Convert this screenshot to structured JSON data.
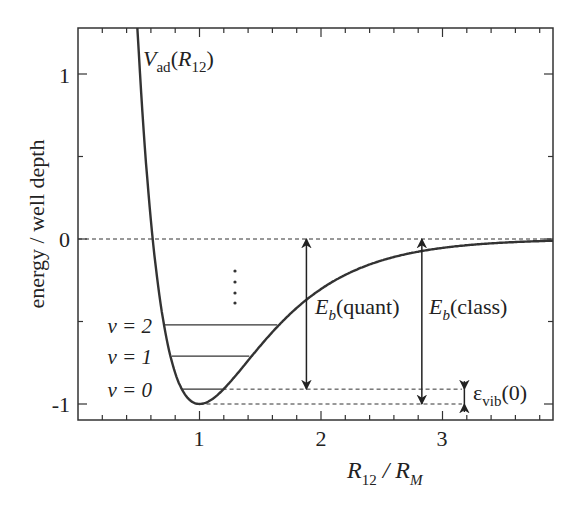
{
  "chart_data": {
    "type": "line",
    "title": "",
    "xlabel": "R12 / RM",
    "ylabel": "energy / well depth",
    "xlim": [
      0.0,
      3.92
    ],
    "ylim": [
      -1.12,
      1.28
    ],
    "x_ticks_major": [
      1,
      2,
      3
    ],
    "x_tick_labels": [
      "1",
      "2",
      "3"
    ],
    "x_minor_step": 0.2,
    "y_ticks_major": [
      1,
      0,
      -1
    ],
    "y_tick_labels": [
      "1",
      "0",
      "-1"
    ],
    "y_minor_ticks": [
      0.5,
      -0.5
    ],
    "grid": false,
    "series": [
      {
        "name": "V_ad(R_12)",
        "model": "Morse: V = (1 - exp(-a(R-1)))^2 - 1",
        "a": 1.8,
        "x": [
          0.5,
          0.61,
          0.8,
          1.0,
          1.2,
          1.5,
          1.85,
          2.0,
          2.5,
          2.85,
          3.5,
          3.92
        ],
        "values": [
          1.06,
          0.0,
          -0.75,
          -1.0,
          -0.89,
          -0.57,
          -0.33,
          -0.27,
          -0.13,
          -0.07,
          -0.02,
          -0.01
        ]
      }
    ],
    "vibrational_levels": [
      {
        "label": "v = 2",
        "energy": -0.52,
        "x_left": 0.71,
        "x_right": 1.64
      },
      {
        "label": "v = 1",
        "energy": -0.71,
        "x_left": 0.77,
        "x_right": 1.41
      },
      {
        "label": "v = 0",
        "energy": -0.91,
        "x_left": 0.86,
        "x_right": 1.19
      }
    ],
    "dashed_lines": [
      {
        "energy": 0.0,
        "x_from": 0.0,
        "x_to": 3.92
      },
      {
        "energy": -0.91,
        "x_from": 1.19,
        "x_to": 3.16
      },
      {
        "energy": -1.0,
        "x_from": 1.0,
        "x_to": 3.16
      }
    ],
    "annotations": [
      {
        "text": "V_ad(R_12)",
        "x": 0.55,
        "y": 1.15
      },
      {
        "text": "E_b(quant)",
        "arrow_x": 1.88,
        "from": -0.91,
        "to": 0.0
      },
      {
        "text": "E_b(class)",
        "arrow_x": 2.83,
        "from": -1.0,
        "to": 0.0
      },
      {
        "text": "ε_vib(0)",
        "arrow_x": 3.18,
        "from": -1.0,
        "to": -0.91
      },
      {
        "text": "⋮",
        "x": 1.29,
        "y": -0.25
      }
    ]
  },
  "labels": {
    "ylabel": "energy / well depth",
    "xlabel_R": "R",
    "xlabel_sub1": "12",
    "xlabel_slash": " / ",
    "xlabel_R2": "R",
    "xlabel_sub2": "M",
    "curve_V": "V",
    "curve_sub": "ad",
    "curve_paren_open": "(",
    "curve_R": "R",
    "curve_R_sub": "12",
    "curve_paren_close": ")",
    "eb_E": "E",
    "eb_sub": "b",
    "eb_quant": "(quant)",
    "eb_class": "(class)",
    "eps": "ε",
    "eps_sub": "vib",
    "eps_arg": "(0)",
    "v2": "v = 2",
    "v1": "v = 1",
    "v0": "v = 0",
    "tick_x1": "1",
    "tick_x2": "2",
    "tick_x3": "3",
    "tick_y1": "1",
    "tick_y0": "0",
    "tick_ym1": "-1"
  }
}
